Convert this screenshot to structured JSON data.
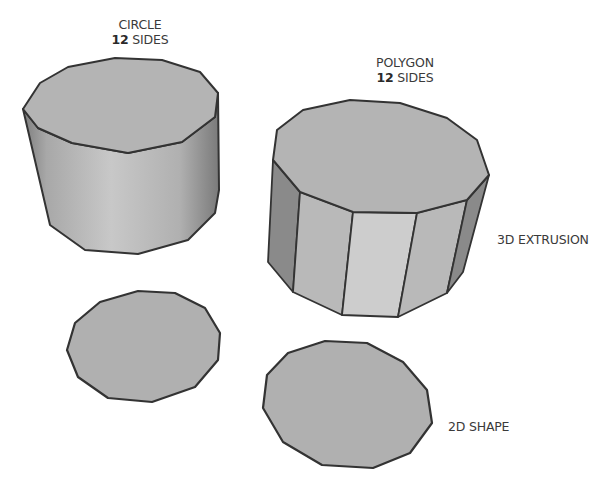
{
  "labels": {
    "circle": {
      "title": "CIRCLE",
      "count": "12",
      "unit": "SIDES"
    },
    "polygon": {
      "title": "POLYGON",
      "count": "12",
      "unit": "SIDES"
    },
    "extrusion": "3D EXTRUSION",
    "shape2d": "2D SHAPE"
  },
  "colors": {
    "background": "#ffffff",
    "outline": "#333333",
    "face_top": "#b4b4b4",
    "face_flat": "#b0b0b0",
    "face_light": "#cdcdcd",
    "face_mid": "#b9b9b9",
    "face_dark": "#8a8a8a",
    "text": "#3a3a3a"
  },
  "shapes": {
    "circle_cylinder": {
      "top": "23,109 40,83 68,67 115,58 162,60 200,72 218,93 215,117 182,142 128,153 72,143 38,128",
      "body": "23,109 38,128 72,143 128,153 182,142 215,117 218,93 219,190 215,213 188,240 138,254 85,250 50,225"
    },
    "polygon_cylinder": {
      "top": "277,130 303,110 350,100 400,103 447,118 477,140 489,175 467,200 417,213 353,212 300,192 273,160",
      "faces": [
        {
          "points": "273,160 300,192 293,292 268,262",
          "shade": "face_dark"
        },
        {
          "points": "300,192 353,212 342,315 293,292",
          "shade": "face_mid"
        },
        {
          "points": "353,212 417,213 398,317 342,315",
          "shade": "face_light"
        },
        {
          "points": "417,213 467,200 447,293 398,317",
          "shade": "face_mid"
        },
        {
          "points": "467,200 489,175 463,272 447,293",
          "shade": "face_dark"
        }
      ]
    },
    "circle_2d": "67,350 75,323 100,302 138,291 175,293 205,308 220,333 218,360 195,387 152,402 108,398 78,377",
    "polygon_2d": "263,408 267,375 288,353 325,341 367,343 403,362 427,390 432,423 410,453 373,468 322,465 283,442"
  }
}
